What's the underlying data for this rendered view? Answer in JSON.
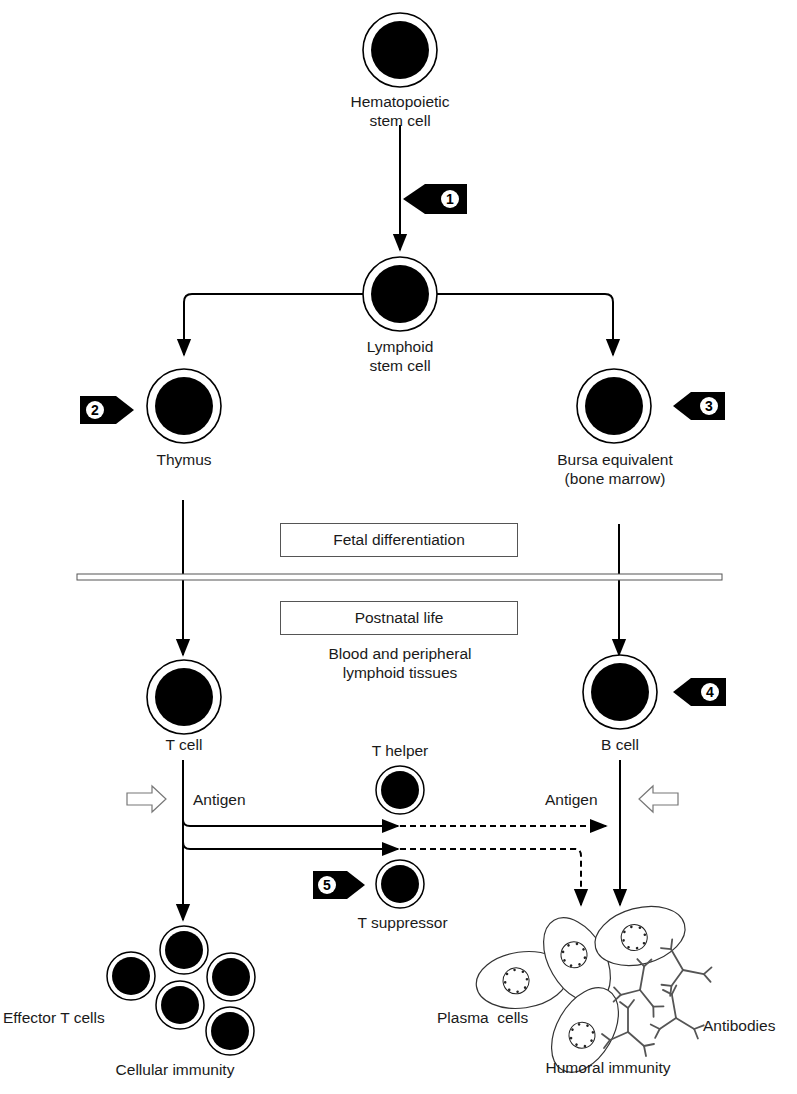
{
  "diagram": {
    "cells": {
      "hematopoietic": {
        "label_line1": "Hematopoietic",
        "label_line2": "stem cell"
      },
      "lymphoid": {
        "label_line1": "Lymphoid",
        "label_line2": "stem cell"
      },
      "thymus": {
        "label": "Thymus"
      },
      "bursa": {
        "label_line1": "Bursa equivalent",
        "label_line2": "(bone marrow)"
      },
      "t_cell": {
        "label": "T cell"
      },
      "b_cell": {
        "label": "B cell"
      },
      "t_helper": {
        "label": "T helper"
      },
      "t_suppressor": {
        "label": "T suppressor"
      }
    },
    "phases": {
      "fetal": "Fetal differentiation",
      "postnatal": "Postnatal life",
      "tissues_line1": "Blood and peripheral",
      "tissues_line2": "lymphoid tissues"
    },
    "antigen_left": "Antigen",
    "antigen_right": "Antigen",
    "outcomes": {
      "effector": "Effector T cells",
      "cellular": "Cellular immunity",
      "plasma": "Plasma  cells",
      "antibodies": "Antibodies",
      "humoral": "Humoral immunity"
    },
    "markers": [
      {
        "num": "1",
        "points": "left"
      },
      {
        "num": "2",
        "points": "right"
      },
      {
        "num": "3",
        "points": "left"
      },
      {
        "num": "4",
        "points": "left"
      },
      {
        "num": "5",
        "points": "right"
      }
    ],
    "colors": {
      "ink": "#000000",
      "line": "#1a1a1a",
      "box_border": "#555555",
      "antibody": "#555555"
    }
  }
}
